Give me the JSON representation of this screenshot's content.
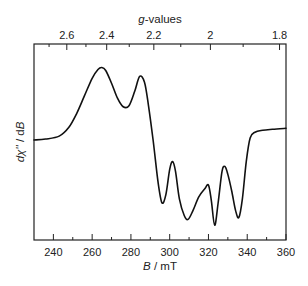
{
  "chart_data": {
    "type": "line",
    "title": "",
    "xlabel_italic": "B",
    "xlabel_rest": " / mT",
    "ylabel_parts": [
      "d",
      "χ''",
      " / d",
      "B"
    ],
    "top_axis_title_italic": "g",
    "top_axis_title_rest": "-values",
    "xlim": [
      230,
      360
    ],
    "x_ticks_major": [
      240,
      260,
      280,
      300,
      320,
      340,
      360
    ],
    "x_ticks_minor": [
      250,
      270,
      290,
      310,
      330,
      350
    ],
    "x_tick_labels": [
      "240",
      "260",
      "280",
      "300",
      "320",
      "340",
      "360"
    ],
    "g_field_product_mT": 642,
    "g_ticks_major": [
      2.6,
      2.4,
      2.2,
      2.0,
      1.8
    ],
    "g_tick_labels": [
      "2.6",
      "2.4",
      "2.2",
      "2",
      "1.8"
    ],
    "g_ticks_minor": [
      2.7,
      2.5,
      2.3,
      2.1,
      1.9
    ],
    "y_ticks": [],
    "ylim": [
      -1,
      1
    ],
    "grid": false,
    "legend": null,
    "series": [
      {
        "name": "EPR derivative spectrum",
        "x": [
          230,
          236,
          243,
          248,
          252,
          256,
          260,
          263,
          265,
          267,
          270,
          273,
          276,
          279,
          282,
          284.5,
          287,
          289,
          291.5,
          294,
          296,
          298,
          300,
          301.5,
          303,
          305,
          307.5,
          309.5,
          312,
          315,
          318,
          320,
          321.5,
          323.2,
          325,
          327,
          328.5,
          330,
          332,
          334,
          335.7,
          337.5,
          339.5,
          341.5,
          344,
          348,
          353,
          360
        ],
        "y": [
          0.02,
          0.03,
          0.06,
          0.15,
          0.29,
          0.47,
          0.65,
          0.74,
          0.76,
          0.73,
          0.6,
          0.45,
          0.36,
          0.37,
          0.52,
          0.67,
          0.61,
          0.38,
          0.01,
          -0.41,
          -0.62,
          -0.54,
          -0.28,
          -0.2,
          -0.3,
          -0.58,
          -0.75,
          -0.79,
          -0.7,
          -0.56,
          -0.48,
          -0.44,
          -0.6,
          -0.85,
          -0.62,
          -0.3,
          -0.25,
          -0.33,
          -0.5,
          -0.7,
          -0.77,
          -0.58,
          -0.2,
          0.04,
          0.1,
          0.12,
          0.13,
          0.14
        ]
      }
    ]
  }
}
